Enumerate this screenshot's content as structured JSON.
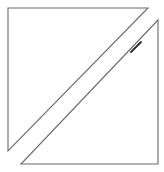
{
  "diagram": {
    "background": "#ffffff",
    "stroke_color": "#6b6b6b",
    "accent_stroke_color": "#2a2a2a",
    "shapes": [
      {
        "name": "upper-left-triangle",
        "points": [
          [
            8,
            8
          ],
          [
            148,
            8
          ],
          [
            8,
            151
          ]
        ]
      },
      {
        "name": "lower-right-triangle",
        "points": [
          [
            158,
            20
          ],
          [
            158,
            164
          ],
          [
            21,
            164
          ]
        ]
      }
    ],
    "accent_segment": {
      "from": [
        131,
        52
      ],
      "to": [
        141,
        42
      ]
    }
  }
}
